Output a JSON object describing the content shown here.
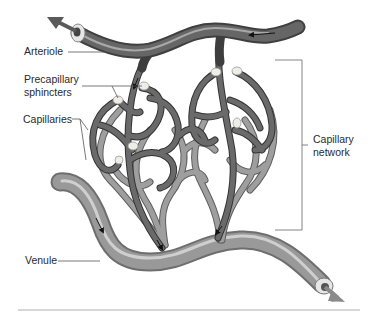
{
  "diagram": {
    "labels": {
      "arteriole": "Arteriole",
      "precapillary_line1": "Precapillary",
      "precapillary_line2": "sphincters",
      "capillaries": "Capillaries",
      "capillary_network_line1": "Capillary",
      "capillary_network_line2": "network",
      "venule": "Venule"
    },
    "colors": {
      "arteriole": "#5a5a5a",
      "arteriole_highlight": "#9a9a9a",
      "capillary_dark": "#4e4e4e",
      "capillary_light": "#8c8c8c",
      "venule": "#8e8e8e",
      "venule_highlight": "#c8c8c8",
      "sphincter": "#e8e8e0",
      "leader_line": "#555555",
      "divider": "#b0b0b0"
    }
  }
}
